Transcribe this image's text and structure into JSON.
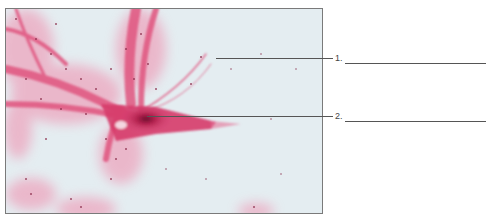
{
  "figure": {
    "type": "micrograph",
    "stain_color": "#d94a78",
    "background_color": "#e4edf1",
    "frame_color": "#7a7a7a"
  },
  "labels": [
    {
      "number": "1.",
      "answer": ""
    },
    {
      "number": "2.",
      "answer": ""
    }
  ]
}
